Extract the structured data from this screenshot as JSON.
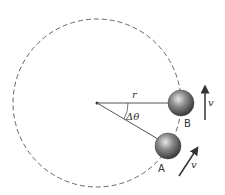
{
  "diagram": {
    "type": "uniform-circular-motion",
    "labels": {
      "radius": "r",
      "angle": "Δθ",
      "point_a": "A",
      "point_b": "B",
      "velocity_a": "v",
      "velocity_b": "v"
    },
    "colors": {
      "line": "#555555",
      "ball": "#777777",
      "arrow": "#333333",
      "dashed_circle": "#666666"
    }
  }
}
